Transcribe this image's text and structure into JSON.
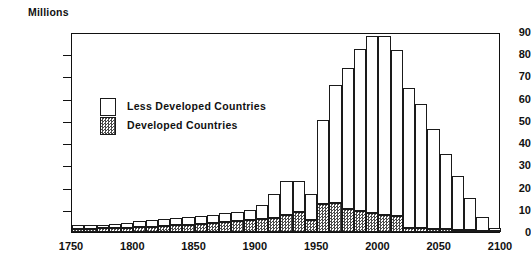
{
  "chart_data": {
    "type": "bar",
    "title": "",
    "subtitle": "",
    "xlabel": "",
    "ylabel": "Millions",
    "ylim": [
      0,
      90
    ],
    "xlim": [
      1750,
      2100
    ],
    "ytick_values": [
      0,
      10,
      20,
      30,
      40,
      50,
      60,
      70,
      80,
      90
    ],
    "ytick_labels": [
      "0",
      "10",
      "20",
      "30",
      "40",
      "50",
      "60",
      "70",
      "80",
      "90"
    ],
    "xtick_values": [
      1750,
      1800,
      1850,
      1900,
      1950,
      2000,
      2050,
      2100
    ],
    "xtick_labels": [
      "1750",
      "1800",
      "1850",
      "1900",
      "1950",
      "2000",
      "2050",
      "2100"
    ],
    "grid": false,
    "stacked": true,
    "legend_position": "upper-left-inside",
    "bin_width_years": 10,
    "categories": [
      1750,
      1760,
      1770,
      1780,
      1790,
      1800,
      1810,
      1820,
      1830,
      1840,
      1850,
      1860,
      1870,
      1880,
      1890,
      1900,
      1910,
      1920,
      1930,
      1940,
      1950,
      1960,
      1970,
      1980,
      1990,
      2000,
      2010,
      2020,
      2030,
      2040,
      2050,
      2060,
      2070,
      2080,
      2090
    ],
    "series": [
      {
        "name": "Developed Countries",
        "fill": "checkered-gray",
        "values": [
          1.5,
          1.5,
          1.6,
          1.8,
          2.0,
          2.2,
          2.4,
          2.6,
          3.0,
          3.2,
          3.6,
          4.0,
          4.4,
          4.8,
          5.2,
          5.8,
          6.2,
          7.5,
          9.0,
          5.5,
          12.5,
          13.0,
          10.5,
          9.5,
          8.5,
          7.5,
          7.0,
          2.0,
          1.6,
          1.4,
          1.2,
          1.0,
          0.8,
          0.6,
          0.3
        ]
      },
      {
        "name": "Less Developed Countries",
        "fill": "white",
        "values": [
          1.5,
          1.5,
          1.6,
          1.8,
          2.2,
          2.6,
          3.0,
          3.2,
          3.4,
          3.6,
          3.6,
          3.6,
          4.0,
          4.4,
          4.8,
          6.2,
          10.8,
          15.5,
          14.0,
          11.5,
          38.0,
          53.0,
          63.5,
          73.0,
          79.5,
          80.5,
          75.0,
          63.0,
          56.0,
          45.0,
          34.0,
          24.0,
          14.5,
          6.0,
          1.7
        ]
      }
    ],
    "totals": [
      3.0,
      3.0,
      3.2,
      3.6,
      4.2,
      4.8,
      5.4,
      5.8,
      6.4,
      6.8,
      7.2,
      7.6,
      8.4,
      9.2,
      10.0,
      12.0,
      17.0,
      23.0,
      23.0,
      17.0,
      50.5,
      66.0,
      74.0,
      82.5,
      88.0,
      88.0,
      82.0,
      65.0,
      57.6,
      46.4,
      35.2,
      25.0,
      15.3,
      6.6,
      2.0
    ]
  },
  "legend": {
    "items": [
      {
        "label": "Less Developed Countries"
      },
      {
        "label": "Developed Countries"
      }
    ]
  },
  "colors": {
    "axis": "#111111",
    "bar_outline": "#1a1a1a",
    "less_developed_fill": "#ffffff",
    "developed_fill": "#4a4a4a",
    "background": "#ffffff"
  }
}
